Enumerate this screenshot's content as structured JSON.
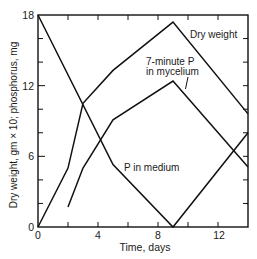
{
  "chart_data": {
    "type": "line",
    "title": "",
    "xlabel": "Time, days",
    "ylabel": "Dry weight, gm × 10; phosphorus, mg",
    "xlim": [
      0,
      14
    ],
    "ylim": [
      0,
      18
    ],
    "grid": false,
    "legend": null,
    "xticks_minor": [
      0,
      2,
      4,
      6,
      8,
      10,
      12,
      14
    ],
    "xtick_values": [
      0,
      4,
      8,
      12
    ],
    "xtick_labels": [
      "0",
      "4",
      "8",
      "12"
    ],
    "yticks_minor": [
      0,
      2,
      4,
      6,
      8,
      10,
      12,
      14,
      16,
      18
    ],
    "ytick_values": [
      0,
      6,
      12,
      18
    ],
    "ytick_labels": [
      "0",
      "6",
      "12",
      "18"
    ],
    "series": [
      {
        "name": "Dry weight",
        "x": [
          0,
          2,
          3,
          5,
          9,
          14
        ],
        "y": [
          0,
          5,
          10.5,
          13.3,
          17.4,
          9.6
        ]
      },
      {
        "name": "7-minute P in mycelium",
        "x": [
          2,
          3,
          5,
          9,
          14
        ],
        "y": [
          1.7,
          5,
          9.1,
          12.4,
          5.1
        ]
      },
      {
        "name": "P in medium",
        "x": [
          0,
          5,
          9,
          14
        ],
        "y": [
          18,
          5.3,
          0,
          8
        ]
      }
    ],
    "annotations": [
      {
        "text": "Dry weight",
        "series": "Dry weight"
      },
      {
        "text": "7-minute P",
        "text_line2": "in mycelium",
        "series": "7-minute P in mycelium",
        "has_pointer": true
      },
      {
        "text": "P in medium",
        "series": "P in medium"
      }
    ],
    "line_color": "#111111",
    "background_color": "#ffffff"
  }
}
